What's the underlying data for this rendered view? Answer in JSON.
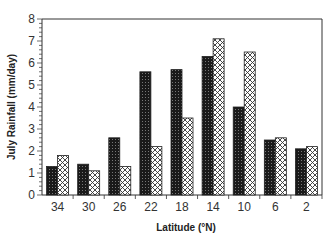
{
  "chart_data": {
    "type": "bar",
    "title": "",
    "xlabel": "Latitude (°N)",
    "ylabel": "July Rainfall (mm/day)",
    "ylim": [
      0,
      8
    ],
    "yticks": [
      0,
      1,
      2,
      3,
      4,
      5,
      6,
      7,
      8
    ],
    "grid": false,
    "legend": null,
    "categories": [
      "34",
      "30",
      "26",
      "22",
      "18",
      "14",
      "10",
      "6",
      "2"
    ],
    "series": [
      {
        "name": "dark-stippled",
        "pattern": "dense dark",
        "values": [
          1.3,
          1.4,
          2.6,
          5.6,
          5.7,
          6.3,
          4.0,
          2.5,
          2.1
        ]
      },
      {
        "name": "light-crosshatched",
        "pattern": "light cross-hatch",
        "values": [
          1.8,
          1.1,
          1.3,
          2.2,
          3.5,
          7.1,
          6.5,
          2.6,
          2.2
        ]
      }
    ]
  },
  "colors": {
    "axis": "#333333",
    "dark_bar": "#222222",
    "light_bar": "#ffffff"
  }
}
